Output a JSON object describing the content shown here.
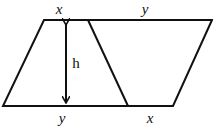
{
  "diagram": {
    "colors": {
      "stroke": "#111111",
      "background": "#ffffff"
    },
    "labels": {
      "top_left": "x",
      "top_right": "y",
      "bottom_left": "y",
      "bottom_right": "x",
      "height": "h"
    },
    "shapes": {
      "outer_parallelogram": [
        [
          44,
          20
        ],
        [
          212,
          20
        ],
        [
          173,
          106
        ],
        [
          3,
          106
        ]
      ],
      "dividing_line": [
        [
          88,
          20
        ],
        [
          128,
          106
        ]
      ],
      "height_arrow": [
        [
          66,
          20
        ],
        [
          66,
          106
        ]
      ]
    }
  }
}
